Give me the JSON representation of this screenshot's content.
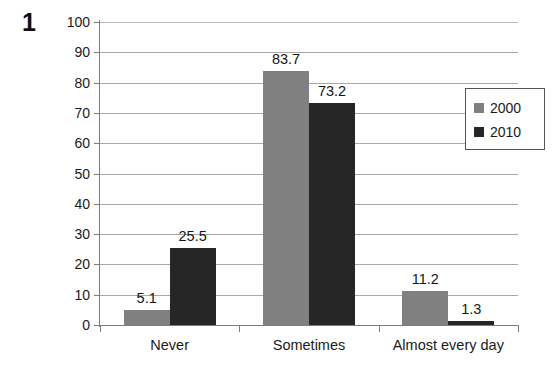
{
  "figure": {
    "number": "1"
  },
  "chart_data": {
    "type": "bar",
    "title": "",
    "subtitle": "",
    "xlabel": "",
    "ylabel": "",
    "ylim": [
      0,
      100
    ],
    "yticks": [
      0,
      10,
      20,
      30,
      40,
      50,
      60,
      70,
      80,
      90,
      100
    ],
    "ytick_labels": [
      "0",
      "10",
      "20",
      "30",
      "40",
      "50",
      "60",
      "70",
      "80",
      "90",
      "100"
    ],
    "grid": true,
    "legend_position": "right",
    "categories": [
      "Never",
      "Sometimes",
      "Almost every day"
    ],
    "series": [
      {
        "name": "2000",
        "color": "#808080",
        "values": [
          5.1,
          83.7,
          11.2
        ],
        "labels": [
          "5.1",
          "83.7",
          "11.2"
        ]
      },
      {
        "name": "2010",
        "color": "#262626",
        "values": [
          25.5,
          73.2,
          1.3
        ],
        "labels": [
          "25.5",
          "73.2",
          "1.3"
        ]
      }
    ]
  },
  "legend": {
    "entries": [
      {
        "label": "2000",
        "swatch": "#808080"
      },
      {
        "label": "2010",
        "swatch": "#262626"
      }
    ]
  },
  "colors": {
    "series_2000": "#808080",
    "series_2010": "#262626",
    "gridline": "#a8a8a8",
    "axis": "#7c7c7c",
    "text": "#1a1a1a",
    "background": "#ffffff"
  }
}
